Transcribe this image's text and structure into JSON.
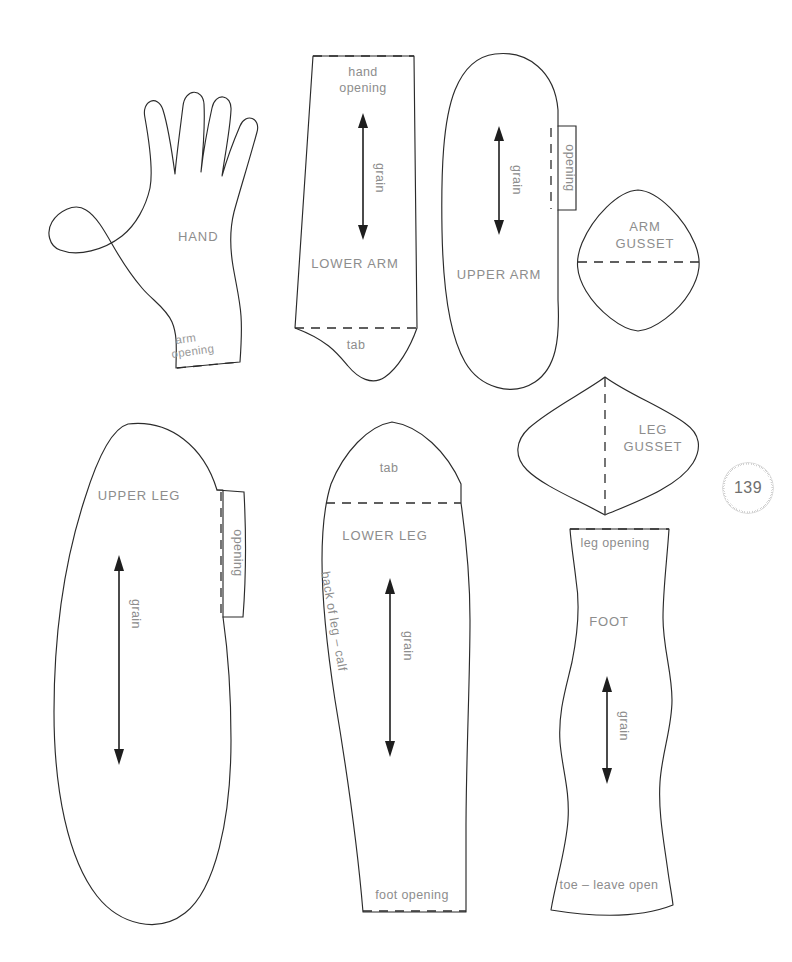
{
  "page": {
    "number": "139",
    "background_color": "#ffffff",
    "line_color": "#2b2b2b",
    "label_color": "#8d8d8d"
  },
  "pieces": [
    {
      "id": "hand",
      "title": "HAND",
      "notes": [
        "arm opening"
      ],
      "grain": false
    },
    {
      "id": "lower-arm",
      "title": "LOWER ARM",
      "notes": [
        "hand opening",
        "tab"
      ],
      "grain": true,
      "grain_label": "grain"
    },
    {
      "id": "upper-arm",
      "title": "UPPER ARM",
      "notes": [
        "opening"
      ],
      "grain": true,
      "grain_label": "grain"
    },
    {
      "id": "arm-gusset",
      "title_line1": "ARM",
      "title_line2": "GUSSET",
      "grain": false
    },
    {
      "id": "upper-leg",
      "title": "UPPER LEG",
      "notes": [
        "opening"
      ],
      "grain": true,
      "grain_label": "grain"
    },
    {
      "id": "lower-leg",
      "title": "LOWER LEG",
      "notes": [
        "tab",
        "back of leg – calf",
        "foot opening"
      ],
      "grain": true,
      "grain_label": "grain"
    },
    {
      "id": "leg-gusset",
      "title_line1": "LEG",
      "title_line2": "GUSSET",
      "grain": false
    },
    {
      "id": "foot",
      "title": "FOOT",
      "notes": [
        "leg opening",
        "toe – leave open"
      ],
      "grain": true,
      "grain_label": "grain"
    }
  ],
  "labels": {
    "hand": "HAND",
    "hand_arm_opening_l1": "arm",
    "hand_arm_opening_l2": "opening",
    "lower_arm": "LOWER ARM",
    "lower_arm_opening_l1": "hand",
    "lower_arm_opening_l2": "opening",
    "lower_arm_tab": "tab",
    "lower_arm_grain": "grain",
    "upper_arm": "UPPER ARM",
    "upper_arm_opening": "opening",
    "upper_arm_grain": "grain",
    "arm_gusset_l1": "ARM",
    "arm_gusset_l2": "GUSSET",
    "upper_leg": "UPPER LEG",
    "upper_leg_opening": "opening",
    "upper_leg_grain": "grain",
    "lower_leg": "LOWER LEG",
    "lower_leg_tab": "tab",
    "lower_leg_calf": "back of leg – calf",
    "lower_leg_foot_opening": "foot opening",
    "lower_leg_grain": "grain",
    "leg_gusset_l1": "LEG",
    "leg_gusset_l2": "GUSSET",
    "foot": "FOOT",
    "foot_leg_opening": "leg opening",
    "foot_toe": "toe – leave open",
    "foot_grain": "grain"
  }
}
